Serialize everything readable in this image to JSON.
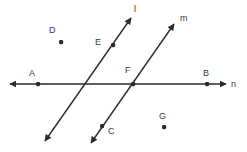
{
  "figure": {
    "background_color": "#ffffff",
    "stroke_color": "#2b2b2b",
    "label_color": "#3a3a3a",
    "width": 247,
    "height": 152
  },
  "lines": [
    {
      "name": "l",
      "label": "l",
      "label_x": 134,
      "label_y": 5,
      "x1": 45,
      "y1": 141,
      "x2": 131,
      "y2": 18,
      "arrow_start": true,
      "arrow_end": true
    },
    {
      "name": "m",
      "label": "m",
      "label_x": 180,
      "label_y": 14,
      "x1": 91,
      "y1": 143,
      "x2": 174,
      "y2": 24,
      "arrow_start": true,
      "arrow_end": true
    },
    {
      "name": "n",
      "label": "n",
      "label_x": 231,
      "label_y": 80,
      "x1": 10,
      "y1": 84,
      "x2": 226,
      "y2": 84,
      "arrow_start": true,
      "arrow_end": true
    }
  ],
  "points": [
    {
      "name": "A",
      "label": "A",
      "x": 38,
      "y": 84,
      "label_x": 29,
      "label_y": 69,
      "on": "n"
    },
    {
      "name": "B",
      "label": "B",
      "x": 207,
      "y": 84,
      "label_x": 203,
      "label_y": 69,
      "on": "n"
    },
    {
      "name": "C",
      "label": "C",
      "x": 102,
      "y": 126,
      "label_x": 108,
      "label_y": 127,
      "on": "m"
    },
    {
      "name": "D",
      "label": "D",
      "x": 61,
      "y": 42,
      "label_x": 49,
      "label_y": 26,
      "on": ""
    },
    {
      "name": "E",
      "label": "E",
      "x": 113,
      "y": 45,
      "label_x": 95,
      "label_y": 38,
      "on": "l"
    },
    {
      "name": "F",
      "label": "F",
      "x": 133,
      "y": 84,
      "label_x": 125,
      "label_y": 66,
      "on": "m,n"
    },
    {
      "name": "G",
      "label": "G",
      "x": 164,
      "y": 127,
      "label_x": 159,
      "label_y": 112,
      "on": ""
    }
  ]
}
